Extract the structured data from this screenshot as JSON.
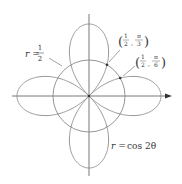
{
  "figure": {
    "curves": [
      {
        "name": "rose",
        "equation": "r = cos 2θ",
        "label_r": "r =",
        "label_rhs": "cos 2θ"
      },
      {
        "name": "circle",
        "equation": "r = 1/2",
        "label_r": "r =",
        "label_num": "1",
        "label_den": "2"
      }
    ],
    "points": [
      {
        "r_num": "1",
        "r_den": "2",
        "theta_num": "π",
        "theta_den": "3",
        "label": "(1/2, π/3)"
      },
      {
        "r_num": "1",
        "r_den": "2",
        "theta_num": "π",
        "theta_den": "6",
        "label": "(1/2, π/6)"
      }
    ],
    "colors": {
      "curve": "#8a8a8a",
      "axis": "#555555",
      "text": "#333333"
    }
  }
}
